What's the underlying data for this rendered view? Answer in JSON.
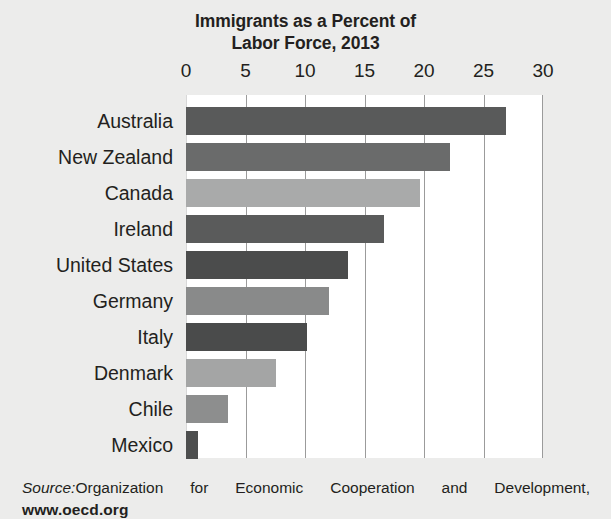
{
  "chart_data": {
    "type": "bar",
    "orientation": "horizontal",
    "title": "Immigrants as a Percent of Labor Force, 2013",
    "title_lines": [
      "Immigrants as a Percent of",
      "Labor Force, 2013"
    ],
    "xlabel": "",
    "ylabel": "",
    "xlim": [
      0,
      30
    ],
    "xticks": [
      0,
      5,
      10,
      15,
      20,
      25,
      30
    ],
    "xtick_labels": [
      "0",
      "5",
      "10",
      "15",
      "20",
      "25",
      "30"
    ],
    "grid": "vertical",
    "legend": "none",
    "categories": [
      "Australia",
      "New Zealand",
      "Canada",
      "Ireland",
      "United States",
      "Germany",
      "Italy",
      "Denmark",
      "Chile",
      "Mexico"
    ],
    "values": [
      26.9,
      22.2,
      19.7,
      16.6,
      13.6,
      12.0,
      10.2,
      7.6,
      3.5,
      1.0
    ],
    "bar_colors": [
      "#595a5a",
      "#6a6b6b",
      "#a9aaaa",
      "#5a5b5b",
      "#4b4c4c",
      "#898a8a",
      "#4a4b4b",
      "#a4a5a5",
      "#8d8e8e",
      "#4d4e4e"
    ],
    "bars": [
      {
        "label": "Australia",
        "value": 26.9,
        "color": "#595a5a"
      },
      {
        "label": "New Zealand",
        "value": 22.2,
        "color": "#6a6b6b"
      },
      {
        "label": "Canada",
        "value": 19.7,
        "color": "#a9aaaa"
      },
      {
        "label": "Ireland",
        "value": 16.6,
        "color": "#5a5b5b"
      },
      {
        "label": "United States",
        "value": 13.6,
        "color": "#4b4c4c"
      },
      {
        "label": "Germany",
        "value": 12.0,
        "color": "#898a8a"
      },
      {
        "label": "Italy",
        "value": 10.2,
        "color": "#4a4b4b"
      },
      {
        "label": "Denmark",
        "value": 7.6,
        "color": "#a4a5a5"
      },
      {
        "label": "Chile",
        "value": 3.5,
        "color": "#8d8e8e"
      },
      {
        "label": "Mexico",
        "value": 1.0,
        "color": "#4d4e4e"
      }
    ]
  },
  "source": {
    "label": "Source:",
    "line1": "Organization for Economic Cooperation and Development,",
    "line2": "www.oecd.org"
  },
  "colors": {
    "page_background": "#ececeb",
    "plot_background": "#ffffff",
    "gridline": "#9b9b9b",
    "text": "#231f20"
  }
}
